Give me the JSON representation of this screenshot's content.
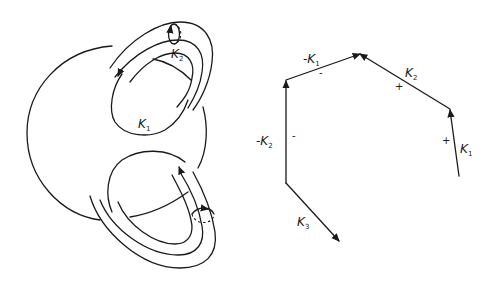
{
  "figure": {
    "left_panel": {
      "description": "sphere with two handles (tubes) and meridian circles",
      "labels": {
        "k1": {
          "main": "K",
          "sub": "1"
        },
        "k2": {
          "main": "K",
          "sub": "2"
        }
      }
    },
    "right_panel": {
      "description": "polygonal path of oriented edges",
      "edges": [
        {
          "id": "k1",
          "label_main": "K",
          "label_sub": "1",
          "prefix": "",
          "sign": "+"
        },
        {
          "id": "k2",
          "label_main": "K",
          "label_sub": "2",
          "prefix": "",
          "sign": "+"
        },
        {
          "id": "neg-k1",
          "label_main": "K",
          "label_sub": "1",
          "prefix": "-",
          "sign": "-"
        },
        {
          "id": "neg-k2",
          "label_main": "K",
          "label_sub": "2",
          "prefix": "-",
          "sign": "-"
        },
        {
          "id": "k3",
          "label_main": "K",
          "label_sub": "3",
          "prefix": "",
          "sign": ""
        }
      ]
    },
    "colors": {
      "ink": "#1a1a1a",
      "background": "#ffffff"
    }
  }
}
